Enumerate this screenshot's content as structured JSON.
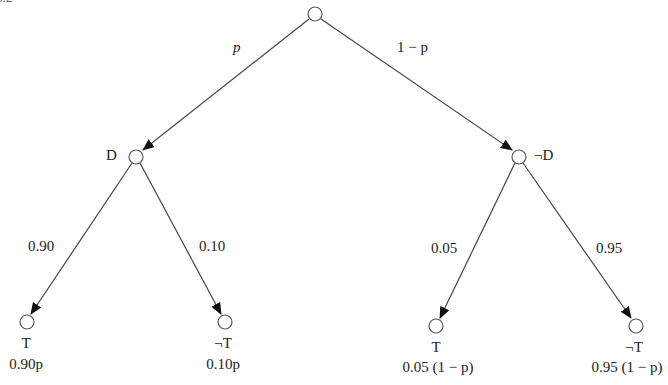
{
  "figure_label": "5.2",
  "tree": {
    "root": {
      "label": ""
    },
    "branches_level1": [
      {
        "prob": "p"
      },
      {
        "prob": "1 − p"
      }
    ],
    "nodes_level1": [
      {
        "label": "D"
      },
      {
        "label": "¬D"
      }
    ],
    "branches_level2": [
      {
        "prob": "0.90"
      },
      {
        "prob": "0.10"
      },
      {
        "prob": "0.05"
      },
      {
        "prob": "0.95"
      }
    ],
    "leaves": [
      {
        "label": "T",
        "joint": "0.90p"
      },
      {
        "label": "¬T",
        "joint": "0.10p"
      },
      {
        "label": "T",
        "joint": "0.05 (1 − p)"
      },
      {
        "label": "¬T",
        "joint": "0.95 (1 − p)"
      }
    ]
  }
}
